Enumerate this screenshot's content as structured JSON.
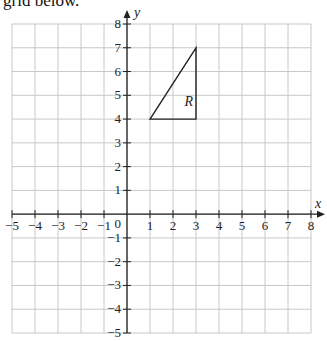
{
  "intro_text": "grid below.",
  "diagram": {
    "x_axis_label": "x",
    "y_axis_label": "y",
    "x_range": [
      -5,
      8
    ],
    "y_range": [
      -5,
      8
    ],
    "x_ticks": [
      -5,
      -4,
      -3,
      -2,
      -1,
      1,
      2,
      3,
      4,
      5,
      6,
      7,
      8
    ],
    "y_ticks": [
      8,
      7,
      6,
      5,
      4,
      3,
      2,
      1,
      -1,
      -2,
      -3,
      -4,
      -5
    ],
    "origin_label": "0",
    "shape": {
      "name": "R",
      "vertices": [
        [
          1,
          4
        ],
        [
          3,
          7
        ],
        [
          3,
          4
        ]
      ]
    },
    "colors": {
      "grid": "#c8c8c8",
      "axis": "#222222",
      "shape": "#222222"
    }
  }
}
